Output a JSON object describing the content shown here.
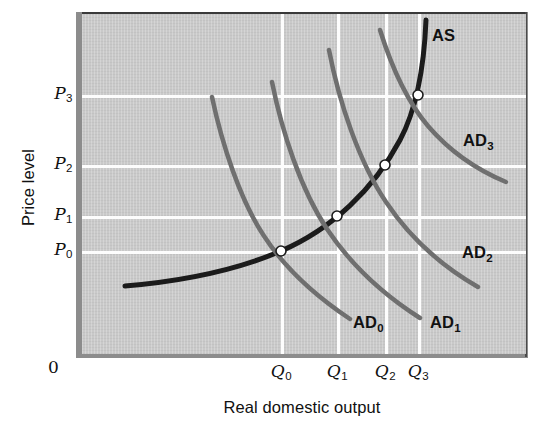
{
  "chart_data": {
    "type": "line",
    "title": "",
    "xlabel": "Real domestic output",
    "ylabel": "Price level",
    "origin_label": "0",
    "grid": true,
    "legend_position": "inline-curve-labels",
    "xlim": [
      0,
      444
    ],
    "ylim": [
      0,
      340
    ],
    "y_ticks": [
      {
        "id": "P0",
        "base": "P",
        "sub": "0",
        "y_px": 251
      },
      {
        "id": "P1",
        "base": "P",
        "sub": "1",
        "y_px": 216
      },
      {
        "id": "P2",
        "base": "P",
        "sub": "2",
        "y_px": 165
      },
      {
        "id": "P3",
        "base": "P",
        "sub": "3",
        "y_px": 95
      }
    ],
    "x_ticks": [
      {
        "id": "Q0",
        "base": "Q",
        "sub": "0",
        "x_px": 281
      },
      {
        "id": "Q1",
        "base": "Q",
        "sub": "1",
        "x_px": 337
      },
      {
        "id": "Q2",
        "base": "Q",
        "sub": "2",
        "x_px": 385
      },
      {
        "id": "Q3",
        "base": "Q",
        "sub": "3",
        "x_px": 418
      }
    ],
    "series": [
      {
        "name": "AS",
        "label_base": "AS",
        "label_sub": "",
        "role": "aggregate-supply",
        "color": "#1b1b1b",
        "width": 5,
        "label_x": 432,
        "label_y": 26,
        "path": "M 43 272 C 90 268, 150 258, 199 237 C 250 215, 292 175, 318 126 C 334 96, 342 56, 344 6"
      },
      {
        "name": "AD0",
        "label_base": "AD",
        "label_sub": "0",
        "role": "aggregate-demand",
        "color": "#6f6f6f",
        "width": 4.5,
        "label_x": 353,
        "label_y": 313,
        "path": "M 130 83 C 140 130, 158 186, 182 222 C 206 259, 238 285, 268 305"
      },
      {
        "name": "AD1",
        "label_base": "AD",
        "label_sub": "1",
        "role": "aggregate-demand",
        "color": "#6f6f6f",
        "width": 4.5,
        "label_x": 430,
        "label_y": 313,
        "path": "M 190 68 C 200 118, 219 176, 245 215 C 271 254, 305 283, 338 304"
      },
      {
        "name": "AD2",
        "label_base": "AD",
        "label_sub": "2",
        "role": "aggregate-demand",
        "color": "#6f6f6f",
        "width": 4.5,
        "label_x": 462,
        "label_y": 243,
        "path": "M 247 36 C 257 88, 277 148, 304 188 C 330 227, 363 254, 396 273"
      },
      {
        "name": "AD3",
        "label_base": "AD",
        "label_sub": "3",
        "role": "aggregate-demand",
        "color": "#6f6f6f",
        "width": 4.5,
        "label_x": 463,
        "label_y": 131,
        "path": "M 298 16 C 308 48, 324 86, 346 112 C 370 140, 400 158, 424 168"
      }
    ],
    "equilibrium_points": [
      {
        "id": "E0",
        "price": "P0",
        "quantity": "Q0",
        "x_px": 199,
        "y_px": 237
      },
      {
        "id": "E1",
        "price": "P1",
        "quantity": "Q1",
        "x_px": 255,
        "y_px": 202
      },
      {
        "id": "E2",
        "price": "P2",
        "quantity": "Q2",
        "x_px": 303,
        "y_px": 151
      },
      {
        "id": "E3",
        "price": "P3",
        "quantity": "Q3",
        "x_px": 336,
        "y_px": 81
      }
    ],
    "colors": {
      "plot_background": "#c9c9c9",
      "gridline": "#fdfdfd",
      "as_curve": "#1b1b1b",
      "ad_curve": "#6f6f6f",
      "frame": "#8c8c8c",
      "text": "#111111",
      "point_fill": "#ffffff"
    }
  }
}
